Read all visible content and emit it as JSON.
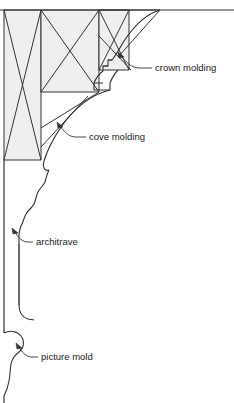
{
  "diagram": {
    "type": "line-drawing",
    "canvas": {
      "width": 234,
      "height": 403
    },
    "colors": {
      "stroke": "#333333",
      "framing_fill": "#f0efee",
      "background": "#ffffff",
      "text": "#1a1a1a"
    },
    "labels": [
      {
        "id": "crown-molding",
        "text": "crown molding",
        "text_x": 160,
        "text_y": 68,
        "leader": "M 152 68 L 140 68 C 131 68 126 62 120 55",
        "arrow_tip_x": 118,
        "arrow_tip_y": 52
      },
      {
        "id": "cove-molding",
        "text": "cove molding",
        "text_x": 93,
        "text_y": 137,
        "leader": "M 86 137 L 76 137 C 68 137 64 131 59 125",
        "arrow_tip_x": 57,
        "arrow_tip_y": 122
      },
      {
        "id": "architrave",
        "text": "architrave",
        "text_x": 40,
        "text_y": 242,
        "leader": "M 33 242 L 28 242 C 22 242 18 237 14 231",
        "arrow_tip_x": 12,
        "arrow_tip_y": 228
      },
      {
        "id": "picture-mold",
        "text": "picture mold",
        "text_x": 45,
        "text_y": 357,
        "leader": "M 38 357 L 32 357 C 26 357 22 352 18 346",
        "arrow_tip_x": 16,
        "arrow_tip_y": 343
      }
    ],
    "parts": [
      {
        "id": "ceiling-line",
        "name": "ceiling line"
      },
      {
        "id": "framing-left-bay",
        "name": "left framing bay with x-brace"
      },
      {
        "id": "framing-middle-bay",
        "name": "middle framing bay with x-brace"
      },
      {
        "id": "framing-right-bay",
        "name": "right framing bay with x-brace"
      },
      {
        "id": "crown-molding-profile",
        "name": "crown molding stepped profile"
      },
      {
        "id": "cove-molding-profile",
        "name": "cove molding concave arc"
      },
      {
        "id": "architrave-profile",
        "name": "architrave ogee profile"
      },
      {
        "id": "picture-mold-profile",
        "name": "picture mold bead profile"
      },
      {
        "id": "wall-line",
        "name": "wall surface line"
      }
    ]
  }
}
